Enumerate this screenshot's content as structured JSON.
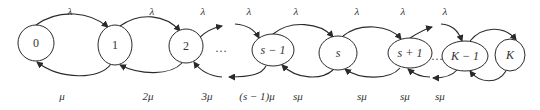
{
  "diagram": {
    "type": "birth-death-chain",
    "nodes": [
      {
        "id": "0",
        "label": "0"
      },
      {
        "id": "1",
        "label": "1"
      },
      {
        "id": "2",
        "label": "2"
      },
      {
        "id": "s-1",
        "label": "s − 1"
      },
      {
        "id": "s",
        "label": "s"
      },
      {
        "id": "s+1",
        "label": "s + 1"
      },
      {
        "id": "K-1",
        "label": "K − 1"
      },
      {
        "id": "K",
        "label": "K"
      }
    ],
    "ellipsis": "…",
    "arrival_labels": [
      "λ",
      "λ",
      "λ",
      "λ",
      "λ",
      "λ",
      "λ",
      "λ"
    ],
    "service_labels": [
      "μ",
      "2μ",
      "3μ",
      "(s − 1)μ",
      "sμ",
      "sμ",
      "sμ",
      "sμ"
    ]
  }
}
